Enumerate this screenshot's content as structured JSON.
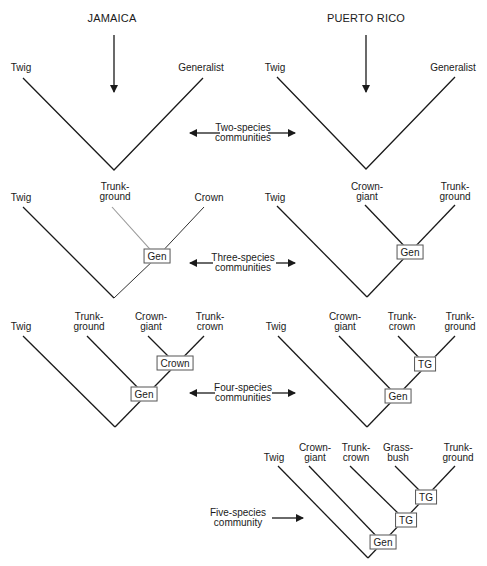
{
  "titles": {
    "left": "JAMAICA",
    "right": "PUERTO RICO"
  },
  "row_labels": {
    "two": "Two-species\ncommunities",
    "three": "Three-species\ncommunities",
    "four": "Four-species\ncommunities",
    "five": "Five-species\ncommunity"
  },
  "jamaica": {
    "two": {
      "tips": [
        "Twig",
        "Generalist"
      ]
    },
    "three": {
      "tips": [
        "Twig",
        "Trunk-\nground",
        "Crown"
      ],
      "nodes": [
        "Gen"
      ]
    },
    "four": {
      "tips": [
        "Twig",
        "Trunk-\nground",
        "Crown-\ngiant",
        "Trunk-\ncrown"
      ],
      "nodes": [
        "Gen",
        "Crown"
      ]
    }
  },
  "puerto_rico": {
    "two": {
      "tips": [
        "Twig",
        "Generalist"
      ]
    },
    "three": {
      "tips": [
        "Twig",
        "Crown-\ngiant",
        "Trunk-\nground"
      ],
      "nodes": [
        "Gen"
      ]
    },
    "four": {
      "tips": [
        "Twig",
        "Crown-\ngiant",
        "Trunk-\ncrown",
        "Trunk-\nground"
      ],
      "nodes": [
        "Gen",
        "TG"
      ]
    },
    "five": {
      "tips": [
        "Twig",
        "Crown-\ngiant",
        "Trunk-\ncrown",
        "Grass-\nbush",
        "Trunk-\nground"
      ],
      "nodes": [
        "Gen",
        "TG",
        "TG"
      ]
    }
  },
  "colors": {
    "line": "#1a1a1a",
    "gray_line": "#999999",
    "box_border": "#555555"
  }
}
